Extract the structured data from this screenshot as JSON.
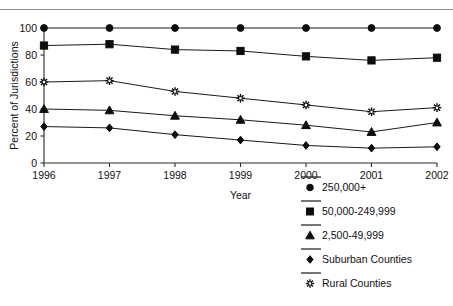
{
  "figure": {
    "top_rule": true,
    "top_ghost_text": "",
    "background": "#ffffff",
    "ink_color": "#111111"
  },
  "chart_data": {
    "type": "line",
    "title": "",
    "xlabel": "Year",
    "ylabel": "Percent of Jurisdictions",
    "x": [
      "1996",
      "1997",
      "1998",
      "1999",
      "2000",
      "2001",
      "2002"
    ],
    "categories": [
      "1996",
      "1997",
      "1998",
      "1999",
      "2000",
      "2001",
      "2002"
    ],
    "xlim": [
      1996,
      2002
    ],
    "ylim": [
      0,
      100
    ],
    "yticks": [
      0,
      20,
      40,
      60,
      80,
      100
    ],
    "ytick_labels": [
      "0",
      "20",
      "40",
      "60",
      "80",
      "100"
    ],
    "grid": false,
    "legend_position": "right-bottom",
    "series": [
      {
        "name": "250,000+",
        "marker": "circle",
        "values": [
          100,
          100,
          100,
          100,
          100,
          100,
          100
        ]
      },
      {
        "name": "50,000-249,999",
        "marker": "square",
        "values": [
          87,
          88,
          84,
          83,
          79,
          76,
          78
        ]
      },
      {
        "name": "2,500-49,999",
        "marker": "triangle",
        "values": [
          40,
          39,
          35,
          32,
          28,
          23,
          30
        ]
      },
      {
        "name": "Suburban Counties",
        "marker": "diamond",
        "values": [
          27,
          26,
          21,
          17,
          13,
          11,
          12
        ]
      },
      {
        "name": "Rural Counties",
        "marker": "asterisk",
        "values": [
          60,
          61,
          53,
          48,
          43,
          38,
          41
        ]
      }
    ]
  },
  "legend": {
    "entries": [
      {
        "label": "250,000+",
        "marker": "circle"
      },
      {
        "label": "50,000-249,999",
        "marker": "square"
      },
      {
        "label": "2,500-49,999",
        "marker": "triangle"
      },
      {
        "label": "Suburban Counties",
        "marker": "diamond"
      },
      {
        "label": "Rural Counties",
        "marker": "asterisk"
      }
    ]
  }
}
